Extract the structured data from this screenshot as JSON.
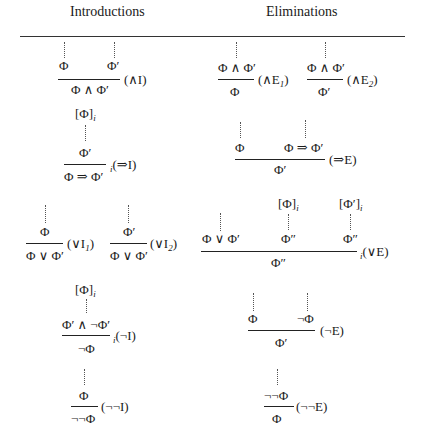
{
  "headers": {
    "introductions": "Introductions",
    "eliminations": "Eliminations"
  },
  "rules": {
    "and_intro": {
      "premises": [
        "Φ",
        "Φ′"
      ],
      "conclusion": "Φ ∧ Φ′",
      "label": "(∧I)"
    },
    "and_elim_1": {
      "premise": "Φ ∧ Φ′",
      "conclusion": "Φ",
      "label_prefix": "(∧E",
      "label_sub": "1",
      "label_suffix": ")"
    },
    "and_elim_2": {
      "premise": "Φ ∧ Φ′",
      "conclusion": "Φ′",
      "label_prefix": "(∧E",
      "label_sub": "2",
      "label_suffix": ")"
    },
    "imp_intro": {
      "assumption": "[Φ]",
      "assumption_sub": "i",
      "premise": "Φ′",
      "conclusion": "Φ ⇒ Φ′",
      "label_index": "i",
      "label": "(⇒I)"
    },
    "imp_elim": {
      "premises": [
        "Φ",
        "Φ ⇒ Φ′"
      ],
      "conclusion": "Φ′",
      "label": "(⇒E)"
    },
    "or_intro_1": {
      "premise": "Φ",
      "conclusion": "Φ ∨ Φ′",
      "label_prefix": "(∨I",
      "label_sub": "1",
      "label_suffix": ")"
    },
    "or_intro_2": {
      "premise": "Φ′",
      "conclusion": "Φ ∨ Φ′",
      "label_prefix": "(∨I",
      "label_sub": "2",
      "label_suffix": ")"
    },
    "or_elim": {
      "assumptions": [
        "[Φ]",
        "[Φ′]"
      ],
      "assumption_sub": "i",
      "premises": [
        "Φ ∨ Φ′",
        "Φ″",
        "Φ″"
      ],
      "conclusion": "Φ″",
      "label_index": "i",
      "label": "(∨E)"
    },
    "not_intro": {
      "assumption": "[Φ]",
      "assumption_sub": "i",
      "premise": "Φ′ ∧ ¬Φ′",
      "conclusion": "¬Φ",
      "label_index": "i",
      "label": "(¬I)"
    },
    "not_elim": {
      "premises": [
        "Φ",
        "¬Φ"
      ],
      "conclusion": "Φ′",
      "label": "(¬E)"
    },
    "dneg_intro": {
      "premise": "Φ",
      "conclusion": "¬¬Φ",
      "label": "(¬¬I)"
    },
    "dneg_elim": {
      "premise": "¬¬Φ",
      "conclusion": "Φ",
      "label": "(¬¬E)"
    }
  }
}
